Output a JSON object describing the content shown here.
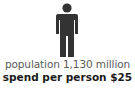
{
  "icon": {
    "name": "person-icon",
    "color": "#333333"
  },
  "population_label": "population 1,130 million",
  "spend_label": "spend per person $25"
}
